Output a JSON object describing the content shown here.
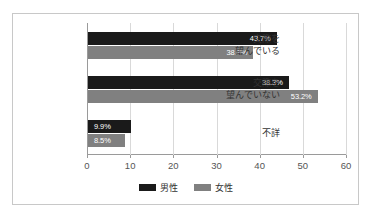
{
  "chart_data": {
    "type": "bar",
    "orientation": "horizontal",
    "title": "",
    "xlabel": "",
    "ylabel": "",
    "categories": [
      "交際を\n望んでいる",
      "交際を\n望んでいない",
      "不詳"
    ],
    "category_lines": [
      [
        "交際を",
        "望んでいる"
      ],
      [
        "交際を",
        "望んでいない"
      ],
      [
        "不詳"
      ]
    ],
    "series": [
      {
        "name": "男性",
        "color": "#1a1a1a",
        "values": [
          43.7,
          46.5,
          9.9
        ],
        "labels": [
          "43.7%",
          "38.3%",
          "9.9%"
        ]
      },
      {
        "name": "女性",
        "color": "#808080",
        "values": [
          38.3,
          53.2,
          8.5
        ],
        "labels": [
          "38.3%",
          "53.2%",
          "8.5%"
        ]
      }
    ],
    "data_labels": [
      {
        "category": "交際を望んでいる",
        "male": "43.7%",
        "female": "38.3%"
      },
      {
        "category": "交際を望んでいない",
        "male": "46.5%",
        "female": "53.2%"
      },
      {
        "category": "不詳",
        "male": "9.9%",
        "female": "8.5%"
      }
    ],
    "xlim": [
      0,
      60
    ],
    "xticks": [
      "0",
      "10",
      "20",
      "30",
      "40",
      "50",
      "60"
    ],
    "xtick_values": [
      0,
      10,
      20,
      30,
      40,
      50,
      60
    ],
    "grid": true,
    "grid_axis": "x",
    "legend": [
      "男性",
      "女性"
    ],
    "legend_position": "bottom"
  },
  "colors": {
    "male": "#1a1a1a",
    "female": "#808080",
    "grid": "#d9d9d9",
    "axis": "#9a9a9a",
    "border": "#c8c8c8",
    "background": "#ffffff",
    "label_text": "#333333",
    "tick_text": "#555555",
    "bar_label_text": "#ffffff"
  }
}
